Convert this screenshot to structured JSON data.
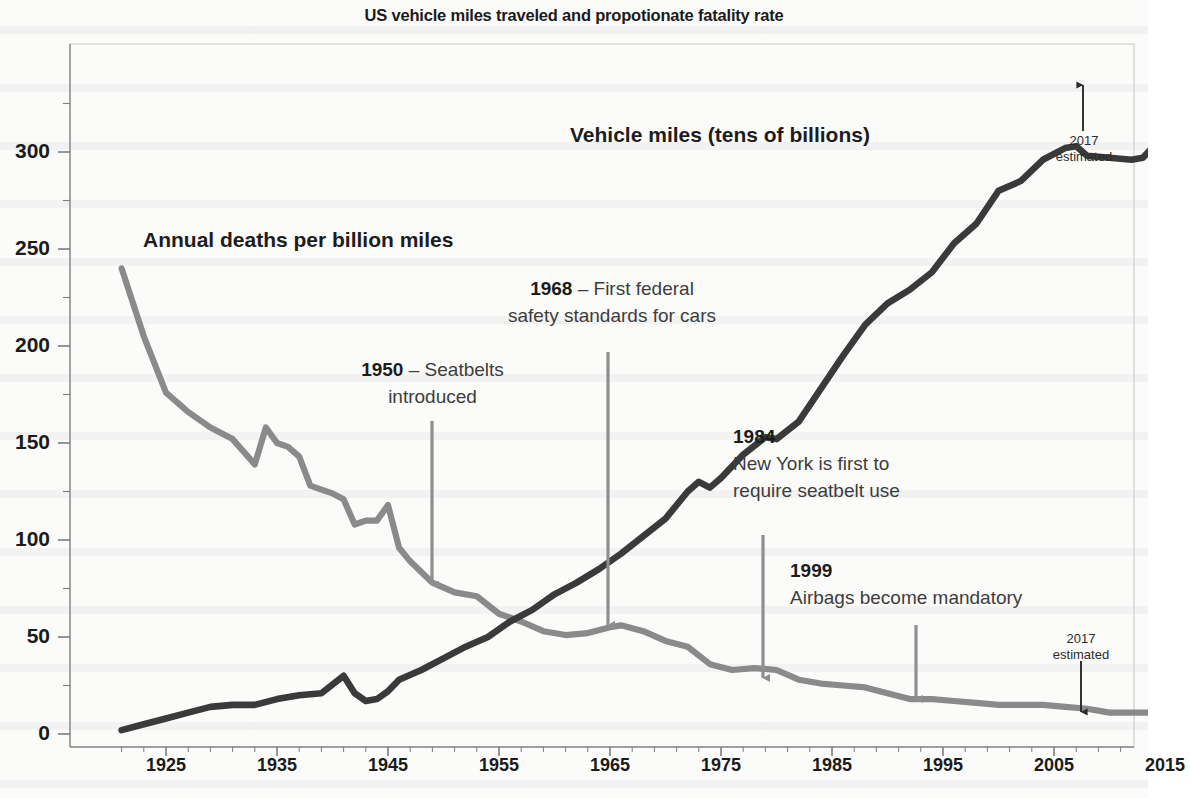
{
  "title": "US vehicle miles traveled and propotionate fatality rate",
  "axes": {
    "y_ticks": [
      "0",
      "50",
      "100",
      "150",
      "200",
      "250",
      "300"
    ],
    "x_ticks": [
      "1925",
      "1935",
      "1945",
      "1955",
      "1965",
      "1975",
      "1985",
      "1995",
      "2005",
      "2015"
    ]
  },
  "series_labels": {
    "miles": "Vehicle miles (tens of billions)",
    "deaths": "Annual deaths per billion miles"
  },
  "annotations": {
    "a1950": {
      "year": "1950",
      "sep": " – ",
      "text_line1": "Seatbelts",
      "text_line2": "introduced"
    },
    "a1968": {
      "year": "1968",
      "sep": " – ",
      "text_line1": "First federal",
      "text_line2": "safety standards for cars"
    },
    "a1984": {
      "year": "1984",
      "text_line1": "New York is first to",
      "text_line2": "require seatbelt use"
    },
    "a1999": {
      "year": "1999",
      "text_line1": "Airbags become mandatory"
    },
    "est_top": {
      "line1": "2017",
      "line2": "estimated"
    },
    "est_bottom": {
      "line1": "2017",
      "line2": "estimated"
    }
  },
  "colors": {
    "miles_line": "#3a3a3a",
    "deaths_line": "#8a8a8a",
    "arrow": "#8f8f8f",
    "est_arrow": "#2b2b2b",
    "axis": "#777777",
    "frame": "#c9c9c9",
    "text": "#1b1b1b"
  },
  "chart_data": {
    "type": "line",
    "title": "US vehicle miles traveled and propotionate fatality rate",
    "xlabel": "",
    "ylabel": "",
    "xlim": [
      1921,
      2017
    ],
    "ylim": [
      0,
      330
    ],
    "grid": false,
    "legend": "inline-labels",
    "xticks": [
      1925,
      1935,
      1945,
      1955,
      1965,
      1975,
      1985,
      1995,
      2005,
      2015
    ],
    "yticks": [
      0,
      50,
      100,
      150,
      200,
      250,
      300
    ],
    "series": [
      {
        "name": "Annual deaths per billion miles",
        "color": "#8a8a8a",
        "x": [
          1921,
          1923,
          1925,
          1927,
          1929,
          1931,
          1933,
          1934,
          1935,
          1936,
          1937,
          1938,
          1939,
          1940,
          1941,
          1942,
          1943,
          1944,
          1945,
          1946,
          1947,
          1949,
          1951,
          1953,
          1955,
          1957,
          1959,
          1961,
          1963,
          1965,
          1966,
          1968,
          1970,
          1972,
          1974,
          1976,
          1978,
          1980,
          1982,
          1984,
          1986,
          1988,
          1990,
          1992,
          1994,
          1996,
          1998,
          2000,
          2002,
          2004,
          2006,
          2008,
          2010,
          2012,
          2014,
          2016,
          2017
        ],
        "values": [
          240,
          205,
          176,
          166,
          158,
          152,
          139,
          158,
          150,
          148,
          143,
          128,
          126,
          124,
          121,
          108,
          110,
          110,
          118,
          96,
          89,
          78,
          73,
          71,
          62,
          58,
          53,
          51,
          52,
          55,
          56,
          53,
          48,
          45,
          36,
          33,
          34,
          33,
          28,
          26,
          25,
          24,
          21,
          18,
          18,
          17,
          16,
          15,
          15,
          15,
          14,
          13,
          11,
          11,
          11,
          12,
          11
        ]
      },
      {
        "name": "Vehicle miles (tens of billions)",
        "color": "#3a3a3a",
        "x": [
          1921,
          1923,
          1925,
          1927,
          1929,
          1931,
          1933,
          1935,
          1937,
          1939,
          1941,
          1942,
          1943,
          1944,
          1945,
          1946,
          1948,
          1950,
          1952,
          1954,
          1956,
          1958,
          1960,
          1962,
          1964,
          1966,
          1968,
          1970,
          1972,
          1973,
          1974,
          1975,
          1977,
          1979,
          1980,
          1982,
          1984,
          1986,
          1988,
          1990,
          1992,
          1994,
          1996,
          1998,
          2000,
          2002,
          2004,
          2006,
          2007,
          2008,
          2010,
          2012,
          2013,
          2014,
          2015,
          2016,
          2017
        ],
        "values": [
          2,
          5,
          8,
          11,
          14,
          15,
          15,
          18,
          20,
          21,
          30,
          21,
          17,
          18,
          22,
          28,
          33,
          39,
          45,
          50,
          58,
          64,
          72,
          78,
          85,
          93,
          102,
          111,
          125,
          130,
          127,
          132,
          144,
          153,
          152,
          161,
          178,
          195,
          211,
          222,
          229,
          238,
          253,
          263,
          280,
          285,
          296,
          302,
          303,
          298,
          297,
          296,
          297,
          303,
          312,
          318,
          322
        ]
      }
    ],
    "annotations": [
      {
        "label": "1950 – Seatbelts introduced",
        "x": 1950,
        "points_to": "deaths"
      },
      {
        "label": "1968 – First federal safety standards for cars",
        "x": 1968,
        "points_to": "deaths"
      },
      {
        "label": "1984 New York is first to require seatbelt use",
        "x": 1984,
        "points_to": "deaths"
      },
      {
        "label": "1999 Airbags become mandatory",
        "x": 1999,
        "points_to": "deaths"
      },
      {
        "label": "2017 estimated",
        "x": 2017,
        "points_to": "miles"
      },
      {
        "label": "2017 estimated",
        "x": 2017,
        "points_to": "deaths"
      }
    ]
  }
}
